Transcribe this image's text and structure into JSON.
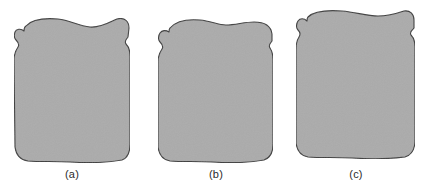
{
  "figure": {
    "background_color": "#ffffff",
    "width": 427,
    "height": 190,
    "shape_fill_color": "#ababab",
    "shape_stroke_color": "#3d3d3d",
    "caption_color": "#2b2b2b"
  },
  "panels": [
    {
      "id": "a",
      "caption": "(a)",
      "description": "rounded quadrilateral blob with raised upper corners and a shallow central dip along the top edge",
      "bounds": {
        "x": 13,
        "y": 18,
        "width": 118,
        "height": 145
      }
    },
    {
      "id": "b",
      "caption": "(b)",
      "description": "rounded quadrilateral blob with a gentle central hump along the top edge",
      "bounds": {
        "x": 157,
        "y": 19,
        "width": 117,
        "height": 144
      }
    },
    {
      "id": "c",
      "caption": "(c)",
      "description": "taller rounded quadrilateral blob with a broad flattened top edge and a stepped notch on the upper right side",
      "bounds": {
        "x": 295,
        "y": 10,
        "width": 121,
        "height": 147
      }
    }
  ]
}
